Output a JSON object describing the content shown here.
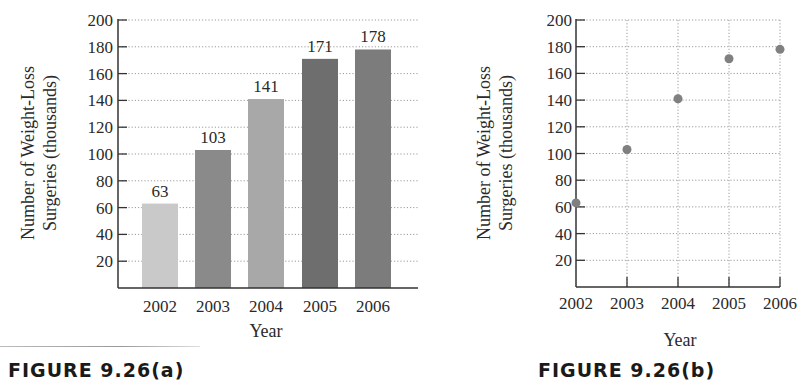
{
  "figures": [
    {
      "caption": "FIGURE 9.26(a)",
      "xlabel": "Year",
      "ylabel_line1": "Number of Weight-Loss",
      "ylabel_line2": "Surgeries (thousands)"
    },
    {
      "caption": "FIGURE 9.26(b)",
      "xlabel": "Year",
      "ylabel_line1": "Number of Weight-Loss",
      "ylabel_line2": "Surgeries (thousands)"
    }
  ],
  "chart_data": [
    {
      "type": "bar",
      "title": "FIGURE 9.26(a)",
      "categories": [
        "2002",
        "2003",
        "2004",
        "2005",
        "2006"
      ],
      "values": [
        63,
        103,
        141,
        171,
        178
      ],
      "data_labels": [
        "63",
        "103",
        "141",
        "171",
        "178"
      ],
      "bar_colors": [
        "#c9c9c9",
        "#8a8a8a",
        "#a8a8a8",
        "#6e6e6e",
        "#7c7c7c"
      ],
      "xlabel": "Year",
      "ylabel": "Number of Weight-Loss Surgeries (thousands)",
      "yticks": [
        20,
        40,
        60,
        80,
        100,
        120,
        140,
        160,
        180,
        200
      ],
      "ylim": [
        0,
        200
      ],
      "grid": "horizontal dotted"
    },
    {
      "type": "scatter",
      "title": "FIGURE 9.26(b)",
      "x": [
        "2002",
        "2003",
        "2004",
        "2005",
        "2006"
      ],
      "y": [
        63,
        103,
        141,
        171,
        178
      ],
      "point_color": "#808080",
      "xlabel": "Year",
      "ylabel": "Number of Weight-Loss Surgeries (thousands)",
      "yticks": [
        20,
        40,
        60,
        80,
        100,
        120,
        140,
        160,
        180,
        200
      ],
      "ylim": [
        0,
        200
      ],
      "grid": "both dotted"
    }
  ]
}
